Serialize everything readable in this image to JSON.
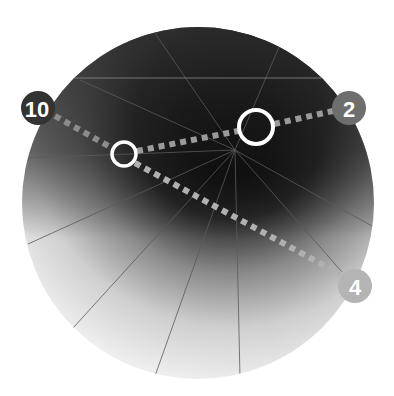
{
  "diagram": {
    "type": "radial-disc-with-connections",
    "disc": {
      "center": [
        198,
        203
      ],
      "radius": 176,
      "gradient_dark": "#0a0a0a",
      "gradient_light": "#f2f2f2",
      "dark_focus": [
        230,
        120
      ]
    },
    "labels": [
      {
        "id": "n10",
        "text": "10",
        "x": 38,
        "y": 108,
        "r": 17,
        "fill": "#333333"
      },
      {
        "id": "n2",
        "text": "2",
        "x": 349,
        "y": 108,
        "r": 17,
        "fill": "#6e6e6e"
      },
      {
        "id": "n4",
        "text": "4",
        "x": 355,
        "y": 286,
        "r": 17,
        "fill": "#b4b4b4"
      }
    ],
    "markers": [
      {
        "id": "large-ring",
        "x": 256,
        "y": 127,
        "r": 17
      },
      {
        "id": "small-ring",
        "x": 124,
        "y": 154,
        "r": 12
      }
    ],
    "connections": [
      {
        "from": "n10",
        "to": "small-ring"
      },
      {
        "from": "small-ring",
        "to": "large-ring"
      },
      {
        "from": "large-ring",
        "to": "n2"
      },
      {
        "from": "small-ring",
        "to": "n4"
      }
    ],
    "colors": {
      "connector": "#9a9a9a",
      "ring": "#ffffff",
      "radial_line": "#5a5a5a"
    }
  }
}
